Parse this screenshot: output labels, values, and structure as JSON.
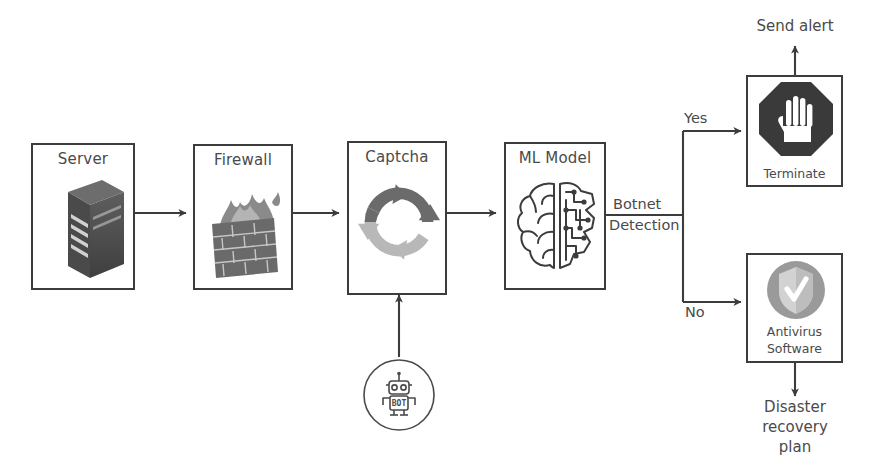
{
  "diagram": {
    "colors": {
      "stroke": "#3c3c3c",
      "text": "#4a4a4a",
      "icon_dark": "#3a3a3a",
      "icon_mid": "#6b6b6b",
      "icon_light": "#b8b8b8",
      "background": "#ffffff"
    },
    "nodes": [
      {
        "id": "server",
        "label": "Server",
        "caption": "",
        "icon": "server-rack-icon"
      },
      {
        "id": "firewall",
        "label": "Firewall",
        "caption": "",
        "icon": "brick-wall-flame-icon"
      },
      {
        "id": "captcha",
        "label": "Captcha",
        "caption": "",
        "icon": "recaptcha-arrows-icon"
      },
      {
        "id": "mlmodel",
        "label": "ML Model",
        "caption": "",
        "icon": "brain-circuit-icon"
      },
      {
        "id": "terminate",
        "label": "",
        "caption": "Terminate",
        "icon": "stop-hand-octagon-icon"
      },
      {
        "id": "antivirus",
        "label": "",
        "caption": "Antivirus\nSoftware",
        "icon": "shield-check-icon"
      }
    ],
    "node_captions": {
      "terminate": "Terminate",
      "antivirus_line1": "Antivirus",
      "antivirus_line2": "Software"
    },
    "bot_source": {
      "id": "bot",
      "icon": "bot-robot-circle-icon",
      "badge_text": "BOT"
    },
    "edge_labels": {
      "botnet_line1": "Botnet",
      "botnet_line2": "Detection",
      "yes": "Yes",
      "no": "No"
    },
    "free_labels": {
      "send_alert": "Send alert",
      "disaster_line1": "Disaster",
      "disaster_line2": "recovery",
      "disaster_line3": "plan"
    }
  }
}
